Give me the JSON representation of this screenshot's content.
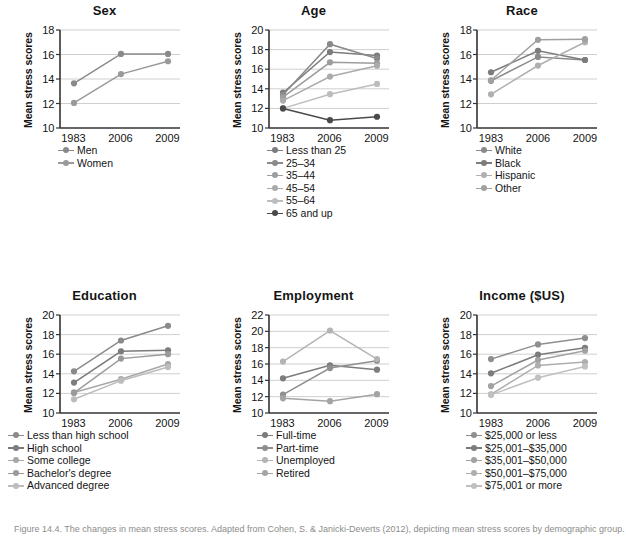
{
  "figure": {
    "caption": "Figure 14.4. The changes in mean stress scores. Adapted from Cohen, S. & Janicki-Deverts (2012), depicting mean stress scores by demographic group."
  },
  "axis": {
    "ylabel": "Mean stress scores",
    "xticks": [
      "1983",
      "2006",
      "2009"
    ]
  },
  "colors": {
    "series_dark": "#6e6e6e",
    "series_mid": "#8a8a8a",
    "series_light": "#a8a8a8",
    "series_lighter": "#b9b9b9",
    "series_lightest": "#c6c6c6",
    "series_darkest": "#4a4a4a",
    "grid": "#cfcfcf",
    "axis": "#333333",
    "caption": "#8c8c8c"
  },
  "chart_data": [
    {
      "id": "sex",
      "type": "line",
      "title": "Sex",
      "xlabel": "",
      "ylabel": "Mean stress scores",
      "x": [
        "1983",
        "2006",
        "2009"
      ],
      "ylim": [
        10,
        18
      ],
      "yticks": [
        10,
        12,
        14,
        16,
        18
      ],
      "grid": true,
      "legend_position": "below",
      "series": [
        {
          "name": "Men",
          "values": [
            13.65,
            16.05,
            16.05
          ],
          "color": "#8a8a8a"
        },
        {
          "name": "Women",
          "values": [
            12.05,
            14.4,
            15.45
          ],
          "color": "#9a9a9a"
        }
      ]
    },
    {
      "id": "age",
      "type": "line",
      "title": "Age",
      "xlabel": "",
      "ylabel": "Mean stress scores",
      "x": [
        "1983",
        "2006",
        "2009"
      ],
      "ylim": [
        10,
        20
      ],
      "yticks": [
        10,
        12,
        14,
        16,
        18,
        20
      ],
      "grid": true,
      "legend_position": "below",
      "series": [
        {
          "name": "Less than 25",
          "values": [
            13.6,
            17.75,
            17.4
          ],
          "color": "#7c7c7c"
        },
        {
          "name": "25–34",
          "values": [
            13.4,
            18.55,
            17.1
          ],
          "color": "#8a8a8a"
        },
        {
          "name": "35–44",
          "values": [
            13.15,
            16.7,
            16.6
          ],
          "color": "#9d9d9d"
        },
        {
          "name": "45–54",
          "values": [
            12.8,
            15.25,
            16.35
          ],
          "color": "#ababab"
        },
        {
          "name": "55–64",
          "values": [
            12.0,
            13.45,
            14.5
          ],
          "color": "#bdbdbd"
        },
        {
          "name": "65 and up",
          "values": [
            12.0,
            10.8,
            11.15
          ],
          "color": "#4a4a4a"
        }
      ]
    },
    {
      "id": "race",
      "type": "line",
      "title": "Race",
      "xlabel": "",
      "ylabel": "Mean stress scores",
      "x": [
        "1983",
        "2006",
        "2009"
      ],
      "ylim": [
        10,
        18
      ],
      "yticks": [
        10,
        12,
        14,
        16,
        18
      ],
      "grid": true,
      "legend_position": "below",
      "series": [
        {
          "name": "White",
          "values": [
            13.85,
            15.8,
            15.55
          ],
          "color": "#8a8a8a"
        },
        {
          "name": "Black",
          "values": [
            14.55,
            16.3,
            15.55
          ],
          "color": "#7c7c7c"
        },
        {
          "name": "Hispanic",
          "values": [
            12.75,
            15.1,
            17.0
          ],
          "color": "#b0b0b0"
        },
        {
          "name": "Other",
          "values": [
            13.9,
            17.2,
            17.25
          ],
          "color": "#a0a0a0"
        }
      ]
    },
    {
      "id": "education",
      "type": "line",
      "title": "Education",
      "xlabel": "",
      "ylabel": "Mean stress scores",
      "x": [
        "1983",
        "2006",
        "2009"
      ],
      "ylim": [
        10,
        20
      ],
      "yticks": [
        10,
        12,
        14,
        16,
        18,
        20
      ],
      "grid": true,
      "legend_position": "below",
      "series": [
        {
          "name": "Less than high school",
          "values": [
            14.25,
            17.4,
            18.9
          ],
          "color": "#8a8a8a"
        },
        {
          "name": "High school",
          "values": [
            13.1,
            16.3,
            16.4
          ],
          "color": "#7c7c7c"
        },
        {
          "name": "Some college",
          "values": [
            12.1,
            13.45,
            15.0
          ],
          "color": "#a8a8a8"
        },
        {
          "name": "Bachelor's degree",
          "values": [
            12.05,
            15.55,
            16.0
          ],
          "color": "#9a9a9a"
        },
        {
          "name": "Advanced degree",
          "values": [
            11.4,
            13.3,
            14.7
          ],
          "color": "#bcbcbc"
        }
      ]
    },
    {
      "id": "employment",
      "type": "line",
      "title": "Employment",
      "xlabel": "",
      "ylabel": "Mean stress scores",
      "x": [
        "1983",
        "2006",
        "2009"
      ],
      "ylim": [
        10,
        22
      ],
      "yticks": [
        10,
        12,
        14,
        16,
        18,
        20,
        22
      ],
      "grid": true,
      "legend_position": "below",
      "series": [
        {
          "name": "Full-time",
          "values": [
            14.25,
            15.85,
            15.3
          ],
          "color": "#7c7c7c"
        },
        {
          "name": "Part-time",
          "values": [
            12.25,
            15.5,
            16.4
          ],
          "color": "#8f8f8f"
        },
        {
          "name": "Unemployed",
          "values": [
            16.3,
            20.1,
            16.6
          ],
          "color": "#b4b4b4"
        },
        {
          "name": "Retired",
          "values": [
            11.8,
            11.45,
            12.3
          ],
          "color": "#a4a4a4"
        }
      ]
    },
    {
      "id": "income",
      "type": "line",
      "title": "Income ($US)",
      "xlabel": "",
      "ylabel": "Mean stress scores",
      "x": [
        "1983",
        "2006",
        "2009"
      ],
      "ylim": [
        10,
        20
      ],
      "yticks": [
        10,
        12,
        14,
        16,
        18,
        20
      ],
      "grid": true,
      "legend_position": "below",
      "series": [
        {
          "name": "$25,000 or less",
          "values": [
            15.5,
            17.0,
            17.65
          ],
          "color": "#8f8f8f"
        },
        {
          "name": "$25,001–$35,000",
          "values": [
            14.05,
            15.95,
            16.65
          ],
          "color": "#7c7c7c"
        },
        {
          "name": "$35,001–$50,000",
          "values": [
            12.75,
            15.4,
            16.35
          ],
          "color": "#a2a2a2"
        },
        {
          "name": "$50,001–$75,000",
          "values": [
            11.9,
            14.85,
            15.2
          ],
          "color": "#aeaeae"
        },
        {
          "name": "$75,001 or more",
          "values": [
            11.85,
            13.6,
            14.75
          ],
          "color": "#c0c0c0"
        }
      ]
    }
  ]
}
